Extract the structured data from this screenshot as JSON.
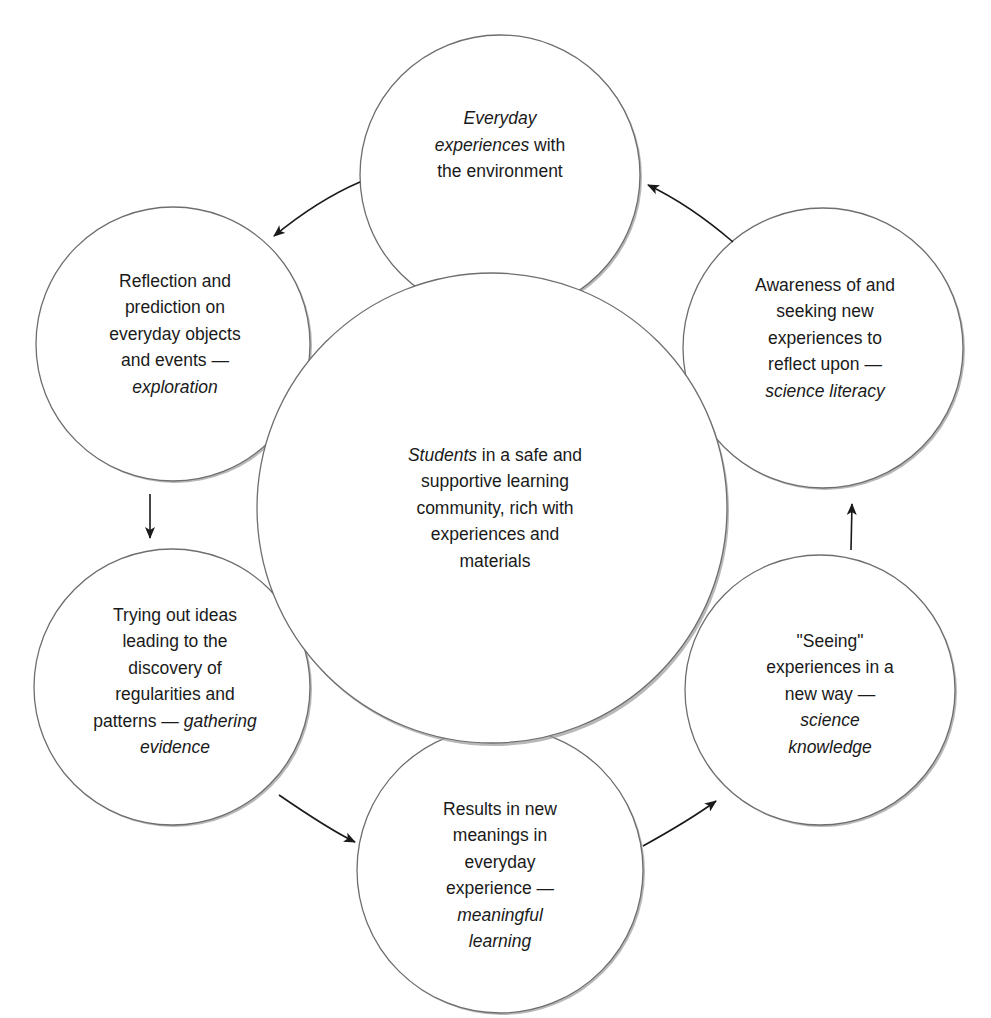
{
  "diagram": {
    "type": "cycle",
    "center": {
      "id": "center",
      "lines": [
        [
          {
            "t": "Students",
            "i": true
          },
          {
            "t": " in a safe and",
            "i": false
          }
        ],
        [
          {
            "t": "supportive learning",
            "i": false
          }
        ],
        [
          {
            "t": "community, rich with",
            "i": false
          }
        ],
        [
          {
            "t": "experiences and",
            "i": false
          }
        ],
        [
          {
            "t": "materials",
            "i": false
          }
        ]
      ],
      "text": "Students in a safe and supportive learning community, rich with experiences and materials"
    },
    "nodes": [
      {
        "id": "everyday-experiences",
        "text": "Everyday experiences with the environment",
        "lines": [
          [
            {
              "t": "Everyday",
              "i": true
            }
          ],
          [
            {
              "t": "experiences",
              "i": true
            },
            {
              "t": " with",
              "i": false
            }
          ],
          [
            {
              "t": "the environment",
              "i": false
            }
          ]
        ]
      },
      {
        "id": "exploration",
        "text": "Reflection and prediction on everyday objects and events — exploration",
        "lines": [
          [
            {
              "t": "Reflection and",
              "i": false
            }
          ],
          [
            {
              "t": "prediction on",
              "i": false
            }
          ],
          [
            {
              "t": "everyday objects",
              "i": false
            }
          ],
          [
            {
              "t": "and events —",
              "i": false
            }
          ],
          [
            {
              "t": "exploration",
              "i": true
            }
          ]
        ]
      },
      {
        "id": "gathering-evidence",
        "text": "Trying out ideas leading to the discovery of regularities and patterns — gathering evidence",
        "lines": [
          [
            {
              "t": "Trying out ideas",
              "i": false
            }
          ],
          [
            {
              "t": "leading to the",
              "i": false
            }
          ],
          [
            {
              "t": "discovery of",
              "i": false
            }
          ],
          [
            {
              "t": "regularities and",
              "i": false
            }
          ],
          [
            {
              "t": "patterns — ",
              "i": false
            },
            {
              "t": "gathering",
              "i": true
            }
          ],
          [
            {
              "t": "evidence",
              "i": true
            }
          ]
        ]
      },
      {
        "id": "meaningful-learning",
        "text": "Results in new meanings in everyday experience — meaningful learning",
        "lines": [
          [
            {
              "t": "Results in new",
              "i": false
            }
          ],
          [
            {
              "t": "meanings in",
              "i": false
            }
          ],
          [
            {
              "t": "everyday",
              "i": false
            }
          ],
          [
            {
              "t": "experience —",
              "i": false
            }
          ],
          [
            {
              "t": "meaningful",
              "i": true
            }
          ],
          [
            {
              "t": "learning",
              "i": true
            }
          ]
        ]
      },
      {
        "id": "science-knowledge",
        "text": "\"Seeing\" experiences in a new way — science knowledge",
        "lines": [
          [
            {
              "t": "\"Seeing\"",
              "i": false
            }
          ],
          [
            {
              "t": "experiences in a",
              "i": false
            }
          ],
          [
            {
              "t": "new way —",
              "i": false
            }
          ],
          [
            {
              "t": "science",
              "i": true
            }
          ],
          [
            {
              "t": "knowledge",
              "i": true
            }
          ]
        ]
      },
      {
        "id": "science-literacy",
        "text": "Awareness of and seeking new experiences to reflect upon — science literacy",
        "lines": [
          [
            {
              "t": "Awareness of and",
              "i": false
            }
          ],
          [
            {
              "t": "seeking new",
              "i": false
            }
          ],
          [
            {
              "t": "experiences to",
              "i": false
            }
          ],
          [
            {
              "t": "reflect upon —",
              "i": false
            }
          ],
          [
            {
              "t": "science literacy",
              "i": true
            }
          ]
        ]
      }
    ],
    "edges": [
      {
        "from": "everyday-experiences",
        "to": "exploration"
      },
      {
        "from": "exploration",
        "to": "gathering-evidence"
      },
      {
        "from": "gathering-evidence",
        "to": "meaningful-learning"
      },
      {
        "from": "meaningful-learning",
        "to": "science-knowledge"
      },
      {
        "from": "science-knowledge",
        "to": "science-literacy"
      },
      {
        "from": "science-literacy",
        "to": "everyday-experiences"
      }
    ],
    "colors": {
      "circle_stroke": "#6e6e6e",
      "circle_fill": "#ffffff",
      "shadow": "#9a9a9a",
      "arrow": "#1a1a1a",
      "text": "#1a1a1a"
    }
  }
}
